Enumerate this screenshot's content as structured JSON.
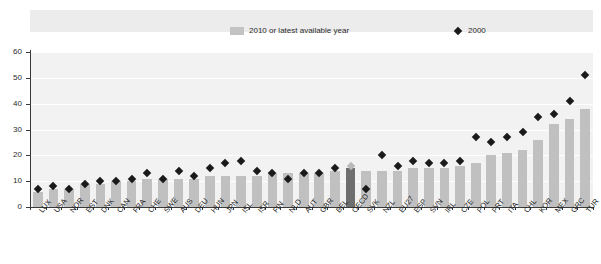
{
  "legend": {
    "bars_label": "2010 or latest available year",
    "points_label": "2000",
    "bar_color": "#c0c0c0",
    "point_color": "#1a1a1a"
  },
  "axis": {
    "y_ticks": [
      "0",
      "10",
      "20",
      "30",
      "40",
      "50",
      "60"
    ],
    "y_min": 0,
    "y_max": 60
  },
  "chart_data": {
    "type": "bar",
    "title": "",
    "subtitle": "",
    "xlabel": "",
    "ylabel": "",
    "ylim": [
      0,
      60
    ],
    "grid": true,
    "legend_position": "top",
    "highlight_category": "OECD",
    "categories": [
      "LUX",
      "USA",
      "NOR",
      "EST",
      "DNK",
      "CAN",
      "FRA",
      "CHE",
      "SWE",
      "AUS",
      "DEU",
      "HUN",
      "JPN",
      "ISL",
      "ISR",
      "FIN",
      "NLD",
      "AUT",
      "GBR",
      "BEL",
      "OECD",
      "SVK",
      "NZL",
      "EU27",
      "ESP",
      "SVN",
      "IRL",
      "CZE",
      "POL",
      "PRT",
      "ITA",
      "CHL",
      "KOR",
      "MEX",
      "GRC",
      "TUR"
    ],
    "series": [
      {
        "name": "2010 or latest available year",
        "type": "bar",
        "color": "#c0c0c0",
        "values": [
          6,
          7,
          7,
          9,
          9,
          10,
          10,
          11,
          11,
          11,
          11,
          12,
          12,
          12,
          12,
          13,
          13,
          13,
          13,
          14,
          15,
          14,
          14,
          14,
          15,
          15,
          15,
          16,
          17,
          20,
          21,
          22,
          26,
          32,
          34,
          38
        ]
      },
      {
        "name": "2000",
        "type": "scatter",
        "marker": "diamond",
        "color": "#1a1a1a",
        "values": [
          7,
          8,
          7,
          9,
          10,
          10,
          11,
          13,
          11,
          14,
          12,
          15,
          17,
          18,
          14,
          13,
          11,
          13,
          13,
          15,
          16,
          7,
          20,
          16,
          18,
          17,
          17,
          18,
          27,
          25,
          27,
          29,
          35,
          36,
          41,
          51
        ]
      }
    ]
  }
}
